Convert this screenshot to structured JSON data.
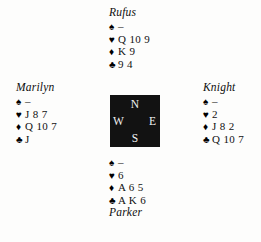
{
  "diagram": {
    "type": "bridge-hand-deal",
    "background_color": "#fdfdfc",
    "text_color": "#111111"
  },
  "suits": {
    "spade": "♠",
    "heart": "♥",
    "diamond": "♦",
    "club": "♣"
  },
  "compass": {
    "background_color": "#121212",
    "label_color": "#f2f2f2",
    "north": "N",
    "west": "W",
    "east": "E",
    "south": "S"
  },
  "hands": {
    "north": {
      "position": "North",
      "name": "Rufus",
      "spades": "–",
      "hearts": "Q 10 9",
      "diamonds": "K 9",
      "clubs": "9 4"
    },
    "west": {
      "position": "West",
      "name": "Marilyn",
      "spades": "–",
      "hearts": "J 8 7",
      "diamonds": "Q 10 7",
      "clubs": "J"
    },
    "east": {
      "position": "East",
      "name": "Knight",
      "spades": "–",
      "hearts": "2",
      "diamonds": "J 8 2",
      "clubs": "Q 10 7"
    },
    "south": {
      "position": "South",
      "name": "Parker",
      "spades": "–",
      "hearts": "6",
      "diamonds": "A 6 5",
      "clubs": "A K 6"
    }
  }
}
